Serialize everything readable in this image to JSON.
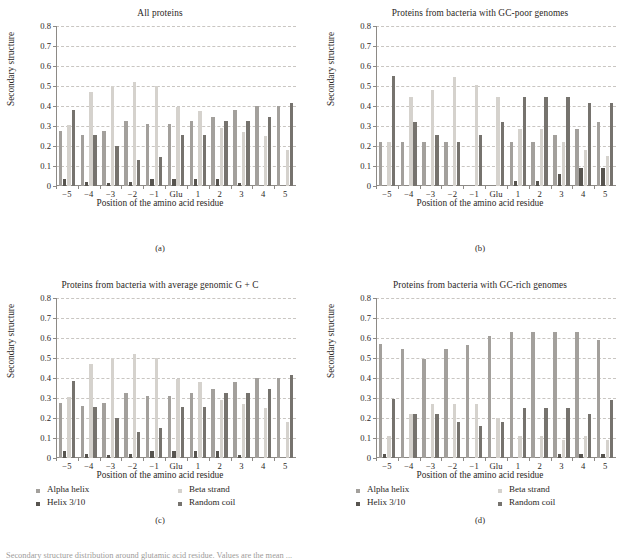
{
  "figure": {
    "caption": "Secondary structure distribution around glutamic acid residue. Values are the mean ..."
  },
  "axes": {
    "ylabel": "Secondary structure",
    "xlabel": "Position of the amino acid residue",
    "yticks": [
      "0",
      "0.1",
      "0.2",
      "0.3",
      "0.4",
      "0.5",
      "0.6",
      "0.7",
      "0.8"
    ],
    "ylim": [
      0,
      0.8
    ],
    "categories": [
      "−5",
      "−4",
      "−3",
      "−2",
      "−1",
      "Glu",
      "1",
      "2",
      "3",
      "4",
      "5"
    ]
  },
  "legend": {
    "position": "below-plot",
    "entries": [
      {
        "label": "Alpha helix",
        "color": "#a3a09c"
      },
      {
        "label": "Helix 3/10",
        "color": "#57544f"
      },
      {
        "label": "Beta strand",
        "color": "#d5d2cd"
      },
      {
        "label": "Random coil",
        "color": "#76736e"
      }
    ]
  },
  "panels": [
    {
      "letter": "(a)",
      "title": "All proteins"
    },
    {
      "letter": "(b)",
      "title": "Proteins from bacteria with GC-poor genomes"
    },
    {
      "letter": "(c)",
      "title": "Proteins from bacteria with average genomic G + C"
    },
    {
      "letter": "(d)",
      "title": "Proteins from bacteria with GC-rich genomes"
    }
  ],
  "chart_data": [
    {
      "type": "bar",
      "panel": "(a)",
      "title": "All proteins",
      "xlabel": "Position of the amino acid residue",
      "ylabel": "Secondary structure",
      "ylim": [
        0,
        0.8
      ],
      "grid": true,
      "categories": [
        "−5",
        "−4",
        "−3",
        "−2",
        "−1",
        "Glu",
        "1",
        "2",
        "3",
        "4",
        "5"
      ],
      "series": [
        {
          "name": "Alpha helix",
          "color": "#a3a09c",
          "values": [
            0.275,
            0.255,
            0.275,
            0.325,
            0.31,
            0.31,
            0.325,
            0.345,
            0.38,
            0.4,
            0.4
          ]
        },
        {
          "name": "Helix 3/10",
          "color": "#57544f",
          "values": [
            0.035,
            0.018,
            0.017,
            0.019,
            0.035,
            0.035,
            0.034,
            0.035,
            0.016,
            0.0,
            0.0
          ]
        },
        {
          "name": "Beta strand",
          "color": "#d5d2cd",
          "values": [
            0.305,
            0.47,
            0.5,
            0.52,
            0.5,
            0.395,
            0.375,
            0.29,
            0.27,
            0.25,
            0.178
          ]
        },
        {
          "name": "Random coil",
          "color": "#76736e",
          "values": [
            0.38,
            0.255,
            0.202,
            0.128,
            0.147,
            0.255,
            0.255,
            0.325,
            0.325,
            0.345,
            0.413
          ]
        }
      ]
    },
    {
      "type": "bar",
      "panel": "(b)",
      "title": "Proteins from bacteria with GC-poor genomes",
      "xlabel": "Position of the amino acid residue",
      "ylabel": "Secondary structure",
      "ylim": [
        0,
        0.8
      ],
      "grid": true,
      "categories": [
        "−5",
        "−4",
        "−3",
        "−2",
        "−1",
        "Glu",
        "1",
        "2",
        "3",
        "4",
        "5"
      ],
      "series": [
        {
          "name": "Alpha helix",
          "color": "#a3a09c",
          "values": [
            0.222,
            0.222,
            0.222,
            0.222,
            0.0,
            0.0,
            0.222,
            0.222,
            0.255,
            0.285,
            0.318
          ]
        },
        {
          "name": "Helix 3/10",
          "color": "#57544f",
          "values": [
            0.0,
            0.0,
            0.0,
            0.0,
            0.0,
            0.0,
            0.027,
            0.025,
            0.058,
            0.09,
            0.09
          ]
        },
        {
          "name": "Beta strand",
          "color": "#d5d2cd",
          "values": [
            0.222,
            0.445,
            0.482,
            0.545,
            0.505,
            0.445,
            0.285,
            0.285,
            0.222,
            0.18,
            0.152
          ]
        },
        {
          "name": "Random coil",
          "color": "#76736e",
          "values": [
            0.548,
            0.32,
            0.255,
            0.222,
            0.255,
            0.32,
            0.447,
            0.447,
            0.447,
            0.415,
            0.415
          ]
        }
      ]
    },
    {
      "type": "bar",
      "panel": "(c)",
      "title": "Proteins from bacteria with average genomic G + C",
      "xlabel": "Position of the amino acid residue",
      "ylabel": "Secondary structure",
      "ylim": [
        0,
        0.8
      ],
      "grid": true,
      "categories": [
        "−5",
        "−4",
        "−3",
        "−2",
        "−1",
        "Glu",
        "1",
        "2",
        "3",
        "4",
        "5"
      ],
      "series": [
        {
          "name": "Alpha helix",
          "color": "#a3a09c",
          "values": [
            0.275,
            0.258,
            0.275,
            0.327,
            0.31,
            0.31,
            0.327,
            0.345,
            0.382,
            0.4,
            0.4
          ]
        },
        {
          "name": "Helix 3/10",
          "color": "#57544f",
          "values": [
            0.036,
            0.018,
            0.017,
            0.019,
            0.035,
            0.036,
            0.034,
            0.036,
            0.016,
            0.0,
            0.0
          ]
        },
        {
          "name": "Beta strand",
          "color": "#d5d2cd",
          "values": [
            0.305,
            0.47,
            0.502,
            0.518,
            0.498,
            0.395,
            0.378,
            0.292,
            0.27,
            0.248,
            0.178
          ]
        },
        {
          "name": "Random coil",
          "color": "#76736e",
          "values": [
            0.385,
            0.257,
            0.2,
            0.13,
            0.148,
            0.255,
            0.255,
            0.325,
            0.325,
            0.345,
            0.415
          ]
        }
      ]
    },
    {
      "type": "bar",
      "panel": "(d)",
      "title": "Proteins from bacteria with GC-rich genomes",
      "xlabel": "Position of the amino acid residue",
      "ylabel": "Secondary structure",
      "ylim": [
        0,
        0.8
      ],
      "grid": true,
      "categories": [
        "−5",
        "−4",
        "−3",
        "−2",
        "−1",
        "Glu",
        "1",
        "2",
        "3",
        "4",
        "5"
      ],
      "series": [
        {
          "name": "Alpha helix",
          "color": "#a3a09c",
          "values": [
            0.568,
            0.543,
            0.497,
            0.543,
            0.565,
            0.61,
            0.632,
            0.632,
            0.632,
            0.632,
            0.588
          ]
        },
        {
          "name": "Helix 3/10",
          "color": "#57544f",
          "values": [
            0.02,
            0.0,
            0.0,
            0.0,
            0.0,
            0.0,
            0.0,
            0.0,
            0.018,
            0.018,
            0.018
          ]
        },
        {
          "name": "Beta strand",
          "color": "#d5d2cd",
          "values": [
            0.11,
            0.222,
            0.268,
            0.268,
            0.268,
            0.2,
            0.11,
            0.11,
            0.088,
            0.11,
            0.092
          ]
        },
        {
          "name": "Random coil",
          "color": "#76736e",
          "values": [
            0.295,
            0.222,
            0.222,
            0.18,
            0.158,
            0.178,
            0.248,
            0.248,
            0.248,
            0.222,
            0.29
          ]
        }
      ]
    }
  ]
}
